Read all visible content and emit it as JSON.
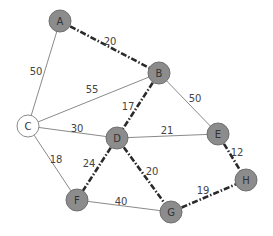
{
  "diagram": {
    "type": "weighted-graph",
    "nodes": [
      {
        "id": "A",
        "label": "A",
        "x": 60,
        "y": 21,
        "style": "filled"
      },
      {
        "id": "B",
        "label": "B",
        "x": 159,
        "y": 73,
        "style": "filled"
      },
      {
        "id": "C",
        "label": "C",
        "x": 28,
        "y": 126,
        "style": "empty"
      },
      {
        "id": "D",
        "label": "D",
        "x": 117,
        "y": 138,
        "style": "filled"
      },
      {
        "id": "E",
        "label": "E",
        "x": 218,
        "y": 134,
        "style": "filled"
      },
      {
        "id": "H",
        "label": "H",
        "x": 246,
        "y": 180,
        "style": "filled"
      },
      {
        "id": "F",
        "label": "F",
        "x": 77,
        "y": 200,
        "style": "filled"
      },
      {
        "id": "G",
        "label": "G",
        "x": 171,
        "y": 212,
        "style": "filled"
      }
    ],
    "edges": [
      {
        "from": "A",
        "to": "C",
        "weight": "50",
        "style": "solid",
        "label_x": 36,
        "label_y": 71
      },
      {
        "from": "A",
        "to": "B",
        "weight": "20",
        "style": "highlight",
        "label_x": 110,
        "label_y": 41
      },
      {
        "from": "C",
        "to": "B",
        "weight": "55",
        "style": "solid",
        "label_x": 92,
        "label_y": 89
      },
      {
        "from": "B",
        "to": "D",
        "weight": "17",
        "style": "highlight",
        "label_x": 128,
        "label_y": 106
      },
      {
        "from": "B",
        "to": "E",
        "weight": "50",
        "style": "solid",
        "label_x": 195,
        "label_y": 98
      },
      {
        "from": "C",
        "to": "D",
        "weight": "30",
        "style": "solid",
        "label_x": 77,
        "label_y": 128
      },
      {
        "from": "D",
        "to": "E",
        "weight": "21",
        "style": "solid",
        "label_x": 167,
        "label_y": 130
      },
      {
        "from": "C",
        "to": "F",
        "weight": "18",
        "style": "solid",
        "label_x": 56,
        "label_y": 159
      },
      {
        "from": "D",
        "to": "F",
        "weight": "24",
        "style": "highlight",
        "label_x": 89,
        "label_y": 163
      },
      {
        "from": "D",
        "to": "G",
        "weight": "20",
        "style": "highlight",
        "label_x": 152,
        "label_y": 171
      },
      {
        "from": "E",
        "to": "H",
        "weight": "12",
        "style": "highlight",
        "label_x": 237,
        "label_y": 152
      },
      {
        "from": "F",
        "to": "G",
        "weight": "40",
        "style": "solid",
        "label_x": 121,
        "label_y": 201
      },
      {
        "from": "G",
        "to": "H",
        "weight": "19",
        "style": "highlight",
        "label_x": 203,
        "label_y": 190
      }
    ],
    "colors": {
      "node_fill": "#8c8c8c",
      "node_stroke": "#6f6f6f",
      "start_node_fill": "#ffffff",
      "solid_edge": "#8a8a8a",
      "highlight_edge": "#2a2a2a",
      "text": "#333333"
    }
  }
}
